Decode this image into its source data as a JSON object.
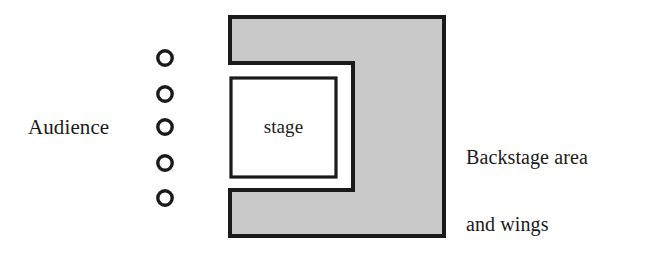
{
  "diagram": {
    "canvas": {
      "width": 667,
      "height": 256,
      "background": "#ffffff"
    },
    "labels": {
      "audience": "Audience",
      "stage": "stage",
      "backstage_line1": "Backstage area",
      "backstage_line2": "and wings"
    },
    "colors": {
      "stroke": "#1a1a1a",
      "fill_gray": "#c9c9c9",
      "fill_white": "#ffffff",
      "text": "#1a1a1a"
    },
    "audience_seats": {
      "count": 5,
      "marker": "circle-outline",
      "center_x": 165,
      "radius": 7.2,
      "stroke_width": 3.4,
      "rows_y": [
        58,
        94,
        127,
        163,
        198
      ]
    },
    "shapes": {
      "backstage_block": {
        "name": "backstage-c-shape",
        "outline_points": "230,17 444,17 444,236 230,236 230,190 353,190 353,63 230,63",
        "fill": "#c9c9c9",
        "stroke": "#1a1a1a",
        "stroke_width": 4
      },
      "stage_box": {
        "name": "stage-rectangle",
        "x": 231,
        "y": 78,
        "width": 105,
        "height": 99,
        "fill": "#ffffff",
        "stroke": "#1a1a1a",
        "stroke_width": 3.2
      }
    }
  }
}
